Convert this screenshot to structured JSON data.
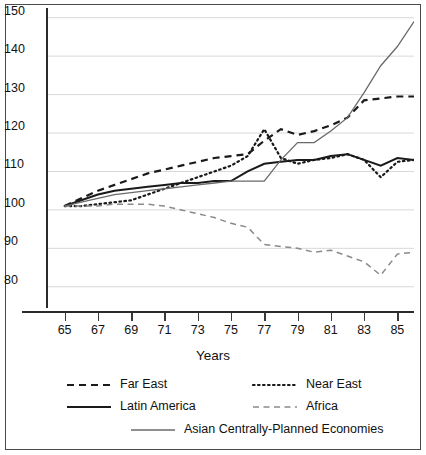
{
  "chart_data": {
    "type": "line",
    "title": "",
    "xlabel": "Years",
    "ylabel": "",
    "xlim": [
      64,
      86
    ],
    "ylim": [
      75,
      152
    ],
    "yticks": [
      80,
      90,
      100,
      110,
      120,
      130,
      140,
      150
    ],
    "xticks": [
      65,
      67,
      69,
      71,
      73,
      75,
      77,
      79,
      81,
      83,
      85
    ],
    "grid": "horizontal",
    "legend_position": "bottom",
    "x": [
      65,
      66,
      67,
      68,
      69,
      70,
      71,
      72,
      73,
      74,
      75,
      76,
      77,
      78,
      79,
      80,
      81,
      82,
      83,
      84,
      85,
      86
    ],
    "series": [
      {
        "name": "Far East",
        "style": "dashed",
        "color": "#1a1a1a",
        "values": [
          101,
          103,
          105,
          106.5,
          108,
          109.5,
          110.5,
          111.5,
          112.5,
          113.5,
          114,
          114.5,
          118,
          121,
          119.5,
          120.5,
          122,
          124,
          128.5,
          129,
          129.5,
          129.5
        ]
      },
      {
        "name": "Near East",
        "style": "dotted",
        "color": "#1a1a1a",
        "values": [
          101,
          101,
          101.5,
          102,
          102.5,
          104,
          105.5,
          107,
          108.5,
          110,
          111.5,
          114,
          121,
          113.5,
          112,
          113,
          113.5,
          114.5,
          113,
          108.5,
          112.5,
          113
        ]
      },
      {
        "name": "Latin America",
        "style": "solid",
        "color": "#1a1a1a",
        "values": [
          101,
          102.5,
          104,
          105,
          105.5,
          106,
          106.5,
          107,
          107,
          107.5,
          107.5,
          110,
          112,
          112.5,
          113,
          113,
          114,
          114.5,
          113,
          111.5,
          113.5,
          113
        ]
      },
      {
        "name": "Africa",
        "style": "dashed-light",
        "color": "#8a8a8a",
        "values": [
          101,
          101,
          101,
          101.5,
          101.5,
          101.5,
          101,
          100,
          99,
          98,
          96.5,
          95.5,
          91,
          90.5,
          90,
          89,
          89.5,
          88,
          86.5,
          83,
          88.5,
          89
        ]
      },
      {
        "name": "Asian Centrally-Planned Economies",
        "style": "solid-thin",
        "color": "#6a6a6a",
        "values": [
          101,
          102,
          103,
          104,
          104.5,
          105,
          105.5,
          106,
          106.5,
          107,
          107.5,
          107.5,
          107.5,
          113,
          117.5,
          117.5,
          120.5,
          124,
          130.5,
          137.5,
          142.5,
          149
        ]
      }
    ]
  },
  "axes": {
    "y_tick_labels": [
      "150",
      "140",
      "130",
      "120",
      "110",
      "100",
      "90",
      "80"
    ],
    "x_tick_labels": [
      "65",
      "67",
      "69",
      "71",
      "73",
      "75",
      "77",
      "79",
      "81",
      "83",
      "85"
    ],
    "x_title": "Years"
  },
  "legend": {
    "entries": [
      {
        "label": "Far East",
        "style": "dashed"
      },
      {
        "label": "Near East",
        "style": "dotted"
      },
      {
        "label": "Latin America",
        "style": "solid"
      },
      {
        "label": "Africa",
        "style": "dashed-light"
      },
      {
        "label": "Asian Centrally-Planned Economies",
        "style": "solid-thin"
      }
    ]
  },
  "colors": {
    "axis": "#2b2b2b",
    "grid": "#d8d8d8",
    "frame": "#4a4a4a",
    "dark_line": "#1a1a1a",
    "light_line": "#8a8a8a",
    "mid_line": "#6a6a6a"
  }
}
